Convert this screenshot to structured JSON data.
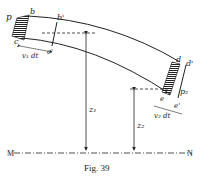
{
  "figure": {
    "caption": "Fig. 39",
    "baseline": {
      "left_label": "M",
      "right_label": "N"
    },
    "labels": {
      "p1": "p",
      "b": "b",
      "b_prime": "b'",
      "c": "c",
      "c_prime": "c'",
      "v1dt": "v₁ dt",
      "z1": "z₁",
      "d": "d",
      "d_prime": "d'",
      "p2": "p₂",
      "e": "e",
      "e_prime": "e'",
      "v2dt": "v₂ dt",
      "z2": "z₂"
    }
  }
}
